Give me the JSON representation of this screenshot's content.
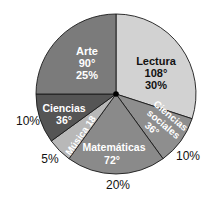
{
  "chart_data": {
    "type": "pie",
    "title": "",
    "center": [
      116,
      94
    ],
    "radius": 80,
    "slices": [
      {
        "name": "Lectura",
        "degrees": 108,
        "percent": "30%",
        "degree_label": "108°",
        "color": "#d2d2d2",
        "text_color": "#111111"
      },
      {
        "name": "Ciencias sociales",
        "degrees": 36,
        "percent": "10%",
        "degree_label": "36°",
        "color": "#8e8e8e",
        "text_color": "#ffffff"
      },
      {
        "name": "Matemáticas",
        "degrees": 72,
        "percent": "20%",
        "degree_label": "72°",
        "color": "#8a8a8a",
        "text_color": "#ffffff"
      },
      {
        "name": "Música",
        "degrees": 18,
        "percent": "5%",
        "degree_label": "18",
        "color": "#b8b8b8",
        "text_color": "#ffffff"
      },
      {
        "name": "Ciencias",
        "degrees": 36,
        "percent": "10%",
        "degree_label": "36°",
        "color": "#555555",
        "text_color": "#ffffff"
      },
      {
        "name": "Arte",
        "degrees": 90,
        "percent": "25%",
        "degree_label": "90°",
        "color": "#7b7b7b",
        "text_color": "#ffffff"
      }
    ],
    "labels": {
      "arte_name": "Arte",
      "arte_deg": "90°",
      "arte_pct": "25%",
      "lectura_name": "Lectura",
      "lectura_deg": "108°",
      "lectura_pct": "30%",
      "ciencias_name": "Ciencias",
      "ciencias_deg": "36°",
      "cs_line1": "Ciencias",
      "cs_line2": "sociales",
      "cs_deg": "36°",
      "mat_name": "Matemáticas",
      "mat_deg": "72°",
      "musica": "Música 18",
      "out_ciencias": "10%",
      "out_musica": "5%",
      "out_mat": "20%",
      "out_cs": "10%"
    }
  }
}
